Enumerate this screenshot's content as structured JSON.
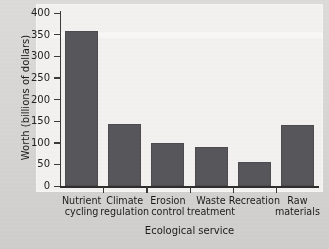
{
  "chart_data": {
    "type": "bar",
    "title": "",
    "categories": [
      "Nutrient\ncycling",
      "Climate\nregulation",
      "Erosion\ncontrol",
      "Waste\ntreatment",
      "Recreation",
      "Raw\nmaterials"
    ],
    "values": [
      358,
      143,
      100,
      90,
      55,
      141
    ],
    "xlabel": "Ecological service",
    "ylabel": "Worth (billions of dollars)",
    "ylim": [
      0,
      400
    ],
    "yticks": [
      0,
      50,
      100,
      150,
      200,
      250,
      300,
      350,
      400
    ],
    "ytick_labels": [
      "0",
      "50",
      "100",
      "150",
      "200",
      "250",
      "300",
      "350",
      "400"
    ],
    "grid": false,
    "legend": null,
    "bar_color": "#57565a",
    "plot_background": "#f2f1ef",
    "figure_background": "#d9d8d6",
    "axis_color": "#2e2e2e"
  }
}
